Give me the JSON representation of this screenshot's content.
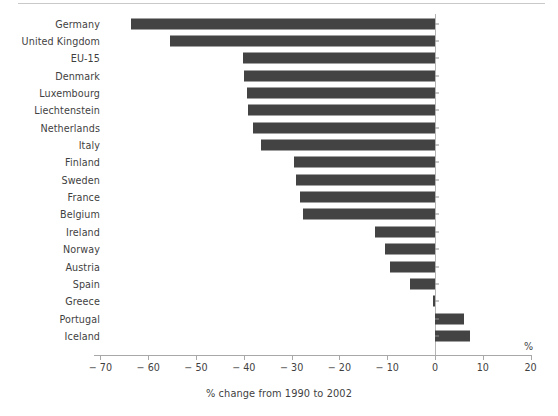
{
  "chart_data": {
    "type": "bar",
    "orientation": "horizontal",
    "title": "",
    "subtitle": "",
    "xlabel": "% change from 1990 to 2002",
    "ylabel": "",
    "unit_label": "%",
    "xlim": [
      -70,
      20
    ],
    "xticks": [
      -70,
      -60,
      -50,
      -40,
      -30,
      -20,
      -10,
      0,
      10,
      20
    ],
    "xtick_labels": [
      "− 70",
      "− 60",
      "− 50",
      "− 40",
      "− 30",
      "− 20",
      "− 10",
      "0",
      "10",
      "20"
    ],
    "grid": false,
    "legend": null,
    "bar_color": "#434343",
    "axis_color": "#a8a8a8",
    "categories": [
      "Germany",
      "United Kingdom",
      "EU-15",
      "Denmark",
      "Luxembourg",
      "Liechtenstein",
      "Netherlands",
      "Italy",
      "Finland",
      "Sweden",
      "France",
      "Belgium",
      "Ireland",
      "Norway",
      "Austria",
      "Spain",
      "Greece",
      "Portugal",
      "Iceland"
    ],
    "values": [
      -63.6,
      -55.4,
      -40.2,
      -40.0,
      -39.3,
      -39.1,
      -38.1,
      -36.4,
      -29.5,
      -29.1,
      -28.2,
      -27.6,
      -12.6,
      -10.5,
      -9.4,
      -5.2,
      -0.4,
      6.1,
      7.3
    ]
  }
}
